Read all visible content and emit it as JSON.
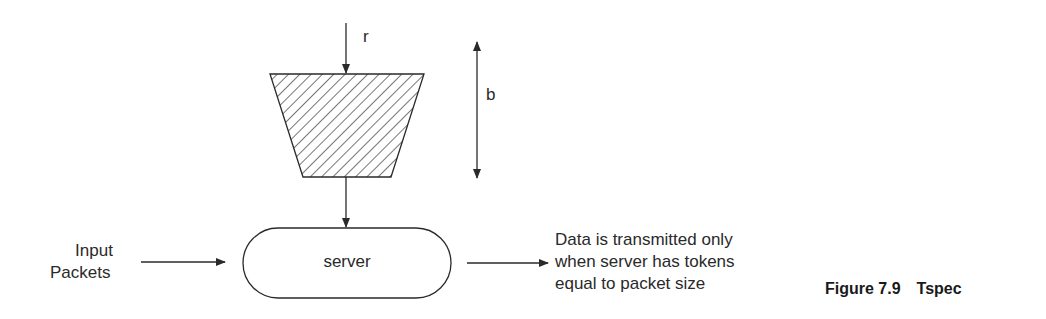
{
  "diagram": {
    "type": "token-bucket",
    "labels": {
      "rate": "r",
      "bucket_depth": "b",
      "server": "server",
      "input_line1": "Input",
      "input_line2": "Packets",
      "output_line1": "Data is transmitted only",
      "output_line2": "when server has tokens",
      "output_line3": "equal to packet size"
    },
    "nodes": [
      {
        "id": "bucket",
        "shape": "trapezoid",
        "fill": "diagonal-hatch"
      },
      {
        "id": "server",
        "shape": "rounded-pill",
        "label": "server"
      }
    ],
    "edges": [
      {
        "from": "rate-r",
        "to": "bucket"
      },
      {
        "from": "bucket",
        "to": "server"
      },
      {
        "from": "input-packets",
        "to": "server"
      },
      {
        "from": "server",
        "to": "output"
      }
    ],
    "colors": {
      "stroke": "#2a2a2a",
      "background": "#ffffff"
    }
  },
  "caption": {
    "figure_number": "Figure 7.9",
    "title": "Tspec"
  }
}
